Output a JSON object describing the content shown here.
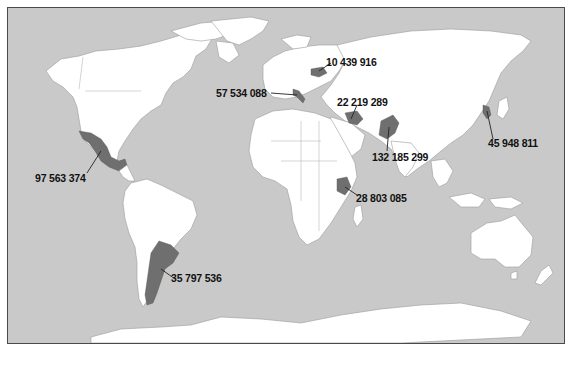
{
  "map": {
    "title": "",
    "colors": {
      "ocean": "#c9c9c9",
      "land": "#ffffff",
      "highlight": "#6f6f6f",
      "label": "#111111"
    },
    "markers": [
      {
        "id": "mexico",
        "value": "97 563 374",
        "label_pos": [
          35,
          178
        ]
      },
      {
        "id": "argentina",
        "value": "35 797 536",
        "label_pos": [
          171,
          276
        ]
      },
      {
        "id": "italy",
        "value": "57 534 088",
        "label_pos": [
          248,
          88
        ]
      },
      {
        "id": "belarus",
        "value": "10 439 916",
        "label_pos": [
          326,
          61
        ]
      },
      {
        "id": "iraq",
        "value": "22 219 289",
        "label_pos": [
          337,
          97
        ]
      },
      {
        "id": "pakistan",
        "value": "132 185 299",
        "label_pos": [
          372,
          153
        ]
      },
      {
        "id": "kenya",
        "value": "28 803 085",
        "label_pos": [
          356,
          195
        ]
      },
      {
        "id": "north-korea",
        "value": "45 948 811",
        "label_pos": [
          488,
          143
        ]
      }
    ]
  }
}
